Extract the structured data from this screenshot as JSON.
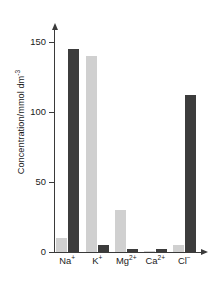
{
  "chart_data": {
    "type": "bar",
    "title": "",
    "subtitle": "",
    "xlabel": "",
    "ylabel": "Concentration/mmol dm",
    "ylabel_exponent": "-3",
    "categories": [
      "Na",
      "K",
      "Mg",
      "Ca",
      "Cl"
    ],
    "category_labels": [
      {
        "base": "Na",
        "sup": "+"
      },
      {
        "base": "K",
        "sup": "+"
      },
      {
        "base": "Mg",
        "sup": "2+"
      },
      {
        "base": "Ca",
        "sup": "2+"
      },
      {
        "base": "Cl",
        "sup": "−"
      }
    ],
    "series": [
      {
        "name": "intracellular",
        "color": "#d0d0d0",
        "values": [
          10,
          140,
          30,
          1,
          5
        ]
      },
      {
        "name": "extracellular",
        "color": "#3c3c3c",
        "values": [
          145,
          5,
          2,
          2,
          112
        ]
      }
    ],
    "ylim": [
      0,
      160
    ],
    "yticks": [
      0,
      50,
      100,
      150
    ],
    "ytick_labels": [
      "0",
      "50",
      "100",
      "150"
    ],
    "grid": false,
    "legend": "none",
    "axis_color": "#3a3a3a",
    "background": "#ffffff"
  },
  "caption": {
    "text": ""
  }
}
